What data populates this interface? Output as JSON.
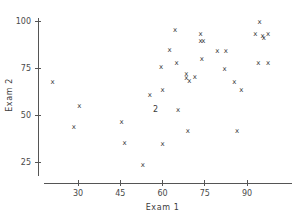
{
  "chart_data": {
    "type": "scatter",
    "title": "",
    "xlabel": "Exam  1",
    "ylabel": "Exam  2",
    "marker": "x",
    "grid": false,
    "legend": null,
    "xlim": [
      13,
      103
    ],
    "ylim": [
      18,
      103
    ],
    "xticks": [
      30,
      45,
      60,
      75,
      90
    ],
    "yticks": [
      25,
      50,
      75,
      100
    ],
    "xtick_labels": [
      "30",
      "45",
      "60",
      "75",
      "90"
    ],
    "ytick_labels": [
      "25",
      "50",
      "75",
      "100"
    ],
    "points": [
      {
        "x": 21.0,
        "y": 68.0,
        "label": "x",
        "count": 1
      },
      {
        "x": 28.5,
        "y": 44.0,
        "label": "x",
        "count": 1
      },
      {
        "x": 30.5,
        "y": 55.0,
        "label": "x",
        "count": 1
      },
      {
        "x": 45.5,
        "y": 46.5,
        "label": "x",
        "count": 1
      },
      {
        "x": 46.5,
        "y": 35.5,
        "label": "x",
        "count": 1
      },
      {
        "x": 53.0,
        "y": 23.5,
        "label": "x",
        "count": 1
      },
      {
        "x": 55.5,
        "y": 61.0,
        "label": "x",
        "count": 1
      },
      {
        "x": 57.5,
        "y": 53.0,
        "label": "2",
        "count": 2
      },
      {
        "x": 59.5,
        "y": 76.0,
        "label": "x",
        "count": 1
      },
      {
        "x": 60.0,
        "y": 63.5,
        "label": "x",
        "count": 1
      },
      {
        "x": 60.0,
        "y": 35.0,
        "label": "x",
        "count": 1
      },
      {
        "x": 62.5,
        "y": 85.0,
        "label": "x",
        "count": 1
      },
      {
        "x": 64.5,
        "y": 95.5,
        "label": "x",
        "count": 1
      },
      {
        "x": 65.0,
        "y": 78.0,
        "label": "x",
        "count": 1
      },
      {
        "x": 65.5,
        "y": 53.0,
        "label": "x",
        "count": 1
      },
      {
        "x": 68.5,
        "y": 72.0,
        "label": "x",
        "count": 1
      },
      {
        "x": 68.5,
        "y": 70.0,
        "label": "x",
        "count": 1
      },
      {
        "x": 69.5,
        "y": 68.5,
        "label": "x",
        "count": 1
      },
      {
        "x": 69.0,
        "y": 42.0,
        "label": "x",
        "count": 1
      },
      {
        "x": 71.5,
        "y": 70.5,
        "label": "x",
        "count": 1
      },
      {
        "x": 73.5,
        "y": 93.5,
        "label": "x",
        "count": 1
      },
      {
        "x": 73.5,
        "y": 89.5,
        "label": "x",
        "count": 1
      },
      {
        "x": 74.5,
        "y": 89.5,
        "label": "x",
        "count": 1
      },
      {
        "x": 74.0,
        "y": 80.0,
        "label": "x",
        "count": 1
      },
      {
        "x": 79.5,
        "y": 84.5,
        "label": "x",
        "count": 1
      },
      {
        "x": 82.5,
        "y": 84.5,
        "label": "x",
        "count": 1
      },
      {
        "x": 82.0,
        "y": 74.5,
        "label": "x",
        "count": 1
      },
      {
        "x": 85.5,
        "y": 68.0,
        "label": "x",
        "count": 1
      },
      {
        "x": 86.5,
        "y": 42.0,
        "label": "x",
        "count": 1
      },
      {
        "x": 88.0,
        "y": 63.5,
        "label": "x",
        "count": 1
      },
      {
        "x": 94.5,
        "y": 99.5,
        "label": "x",
        "count": 1
      },
      {
        "x": 93.0,
        "y": 93.5,
        "label": "x",
        "count": 1
      },
      {
        "x": 95.5,
        "y": 92.5,
        "label": "x",
        "count": 1
      },
      {
        "x": 96.0,
        "y": 91.0,
        "label": "x",
        "count": 1
      },
      {
        "x": 97.5,
        "y": 93.5,
        "label": "x",
        "count": 1
      },
      {
        "x": 94.0,
        "y": 78.0,
        "label": "x",
        "count": 1
      },
      {
        "x": 97.5,
        "y": 78.0,
        "label": "x",
        "count": 1
      }
    ],
    "colors": {
      "axis": "#555555",
      "marker": "#3a3a3a",
      "background": "#ffffff"
    }
  }
}
